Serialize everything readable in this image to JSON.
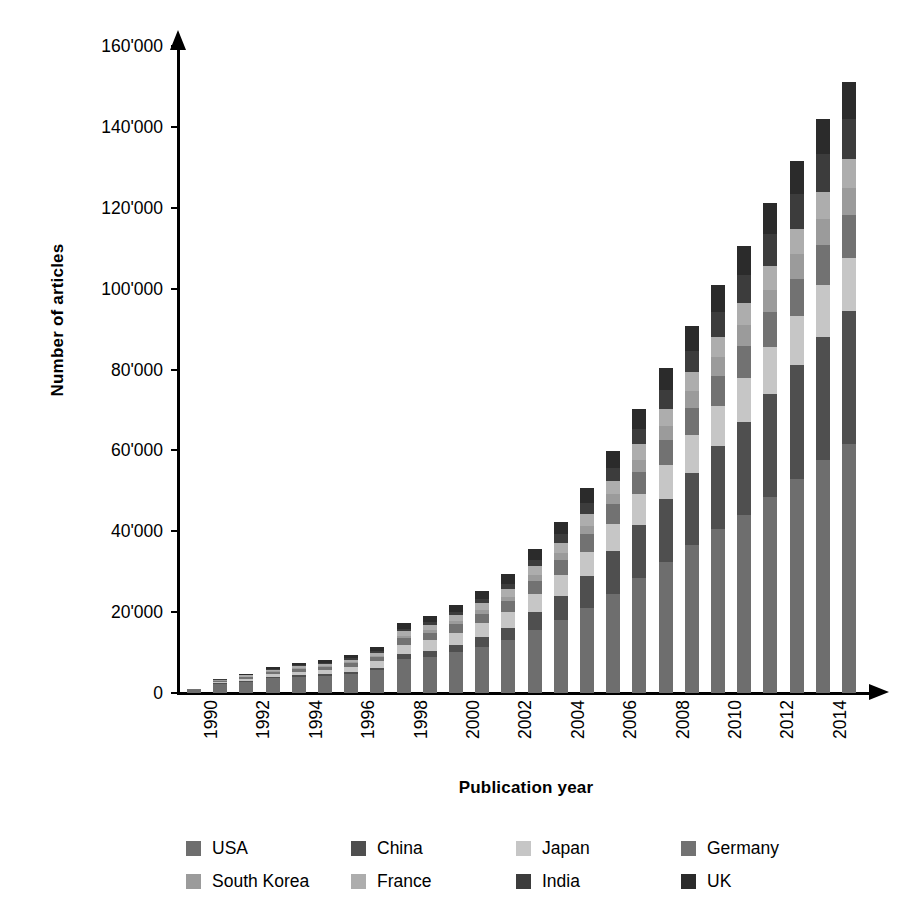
{
  "chart_data": {
    "type": "bar",
    "subtype": "stacked-bar",
    "title": "",
    "xlabel": "Publication year",
    "ylabel": "Number of articles",
    "ylim": [
      0,
      160000
    ],
    "ytick_values": [
      0,
      20000,
      40000,
      60000,
      80000,
      100000,
      120000,
      140000,
      160000
    ],
    "ytick_labels": [
      "0",
      "20'000",
      "40'000",
      "60'000",
      "80'000",
      "100'000",
      "120'000",
      "140'000",
      "160'000"
    ],
    "grid": false,
    "legend_position": "bottom",
    "thousands_separator": "'",
    "categories": [
      "1990",
      "1991",
      "1992",
      "1993",
      "1994",
      "1995",
      "1996",
      "1997",
      "1998",
      "1999",
      "2000",
      "2001",
      "2002",
      "2003",
      "2004",
      "2005",
      "2006",
      "2007",
      "2008",
      "2009",
      "2010",
      "2011",
      "2012",
      "2013",
      "2014",
      "2015"
    ],
    "xtick_labels_shown": [
      "1990",
      "1992",
      "1994",
      "1996",
      "1998",
      "2000",
      "2002",
      "2004",
      "2006",
      "2008",
      "2010",
      "2012",
      "2014"
    ],
    "series": [
      {
        "name": "USA",
        "color": "#6e6e6e",
        "values": [
          700,
          2300,
          2800,
          3600,
          4000,
          4300,
          4800,
          5600,
          8500,
          9000,
          10200,
          11500,
          13000,
          15500,
          18000,
          21000,
          24500,
          28500,
          32500,
          36500,
          40500,
          44000,
          48500,
          53000,
          57500,
          61500
        ]
      },
      {
        "name": "China",
        "color": "#4f4f4f",
        "values": [
          50,
          150,
          200,
          300,
          350,
          400,
          500,
          700,
          1100,
          1400,
          1800,
          2400,
          3200,
          4500,
          6000,
          8000,
          10500,
          13000,
          15500,
          18000,
          20500,
          23000,
          25500,
          28000,
          30500,
          33000
        ]
      },
      {
        "name": "Japan",
        "color": "#c6c6c6",
        "values": [
          80,
          350,
          550,
          750,
          900,
          1000,
          1200,
          1500,
          2300,
          2600,
          2900,
          3300,
          3800,
          4500,
          5200,
          6000,
          6800,
          7600,
          8400,
          9200,
          10000,
          10800,
          11500,
          12200,
          12800,
          13200
        ]
      },
      {
        "name": "Germany",
        "color": "#727272",
        "values": [
          60,
          280,
          420,
          580,
          700,
          780,
          900,
          1100,
          1700,
          1900,
          2100,
          2400,
          2700,
          3200,
          3700,
          4300,
          4900,
          5600,
          6200,
          6900,
          7500,
          8100,
          8700,
          9300,
          9900,
          10400
        ]
      },
      {
        "name": "South Korea",
        "color": "#9b9b9b",
        "values": [
          10,
          60,
          100,
          150,
          190,
          220,
          260,
          330,
          520,
          620,
          740,
          900,
          1100,
          1400,
          1700,
          2100,
          2500,
          3000,
          3500,
          4000,
          4500,
          5000,
          5500,
          6000,
          6500,
          6900
        ]
      },
      {
        "name": "France",
        "color": "#adadad",
        "values": [
          40,
          190,
          290,
          400,
          480,
          540,
          620,
          760,
          1150,
          1300,
          1450,
          1650,
          1900,
          2200,
          2550,
          2950,
          3350,
          3800,
          4250,
          4700,
          5150,
          5550,
          5950,
          6350,
          6700,
          7000
        ]
      },
      {
        "name": "India",
        "color": "#3c3c3c",
        "values": [
          20,
          90,
          140,
          200,
          250,
          290,
          340,
          430,
          680,
          800,
          930,
          1100,
          1350,
          1700,
          2100,
          2600,
          3200,
          3900,
          4600,
          5400,
          6200,
          7000,
          7800,
          8600,
          9400,
          10000
        ]
      },
      {
        "name": "UK",
        "color": "#2b2b2b",
        "values": [
          40,
          180,
          290,
          420,
          530,
          600,
          700,
          880,
          1350,
          1550,
          1750,
          2000,
          2300,
          2700,
          3150,
          3650,
          4200,
          4800,
          5400,
          6000,
          6600,
          7150,
          7700,
          8250,
          8750,
          9200
        ]
      }
    ],
    "totals": [
      1000,
      3600,
      4790,
      6400,
      7400,
      8130,
      9320,
      11300,
      17300,
      19170,
      21870,
      25250,
      29350,
      35700,
      42400,
      50600,
      59950,
      70200,
      80350,
      90700,
      100950,
      110600,
      121150,
      131700,
      142050,
      151200
    ]
  },
  "axis": {
    "y_title": "Number of articles",
    "x_title": "Publication year"
  },
  "legend": {
    "items": [
      {
        "label": "USA",
        "color": "#6e6e6e"
      },
      {
        "label": "China",
        "color": "#4f4f4f"
      },
      {
        "label": "Japan",
        "color": "#c6c6c6"
      },
      {
        "label": "Germany",
        "color": "#727272"
      },
      {
        "label": "South Korea",
        "color": "#9b9b9b"
      },
      {
        "label": "France",
        "color": "#adadad"
      },
      {
        "label": "India",
        "color": "#3c3c3c"
      },
      {
        "label": "UK",
        "color": "#2b2b2b"
      }
    ]
  }
}
